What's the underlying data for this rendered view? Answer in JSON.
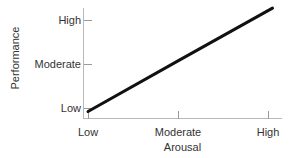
{
  "chart_data": {
    "type": "line",
    "title": "",
    "subtitle": "",
    "xlabel": "Arousal",
    "ylabel": "Performance",
    "x_tick_labels": [
      "Low",
      "Moderate",
      "High"
    ],
    "y_tick_labels": [
      "Low",
      "Moderate",
      "High"
    ],
    "x_tick_values": [
      1,
      2,
      3
    ],
    "y_tick_values": [
      1,
      2,
      3
    ],
    "xlim": [
      0.95,
      3.15
    ],
    "ylim": [
      0.85,
      3.3
    ],
    "grid": false,
    "legend": "none",
    "annotations": [],
    "series": [
      {
        "name": "Arousal vs Performance",
        "color": "#111111",
        "line_width": 3,
        "x": [
          1.0,
          2.0,
          3.05
        ],
        "y": [
          0.92,
          2.07,
          3.27
        ],
        "description": "straight increasing line from low arousal / low performance to high arousal / high performance"
      }
    ]
  },
  "axes": {
    "y": {
      "title": "Performance",
      "ticks": [
        {
          "label": "High",
          "top": 14
        },
        {
          "label": "Moderate",
          "top": 58
        },
        {
          "label": "Low",
          "top": 102
        }
      ]
    },
    "x": {
      "title": "Arousal",
      "ticks": [
        {
          "label": "Low",
          "left": 88
        },
        {
          "label": "Moderate",
          "left": 178
        },
        {
          "label": "High",
          "left": 268
        }
      ]
    }
  },
  "colors": {
    "background": "#ffffff",
    "axis": "#b9b9b9",
    "tick": "#9a9a9a",
    "text": "#333333",
    "data_line": "#111111"
  }
}
